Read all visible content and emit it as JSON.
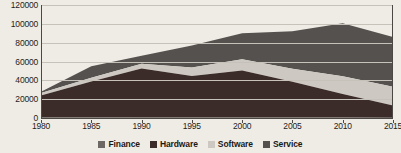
{
  "chart_data": {
    "type": "area",
    "stacked": true,
    "title": "",
    "xlabel": "",
    "ylabel": "",
    "x": [
      1980,
      1985,
      1990,
      1995,
      2000,
      2005,
      2010,
      2015
    ],
    "xlim": [
      1980,
      2015
    ],
    "ylim": [
      0,
      120000
    ],
    "ytick_values": [
      0,
      20000,
      40000,
      60000,
      80000,
      100000,
      120000
    ],
    "ytick_labels": [
      "0",
      "20000",
      "40000",
      "60000",
      "80000",
      "100000",
      "120000"
    ],
    "xtick_labels": [
      "1980",
      "1985",
      "1990",
      "1995",
      "2000",
      "2005",
      "2010",
      "2015"
    ],
    "grid": true,
    "legend_position": "bottom",
    "series": [
      {
        "name": "Finance",
        "color": "#6d6863",
        "values": [
          900,
          700,
          600,
          500,
          500,
          400,
          400,
          300
        ]
      },
      {
        "name": "Hardware",
        "color": "#3b2b29",
        "values": [
          23000,
          38000,
          52000,
          44000,
          50000,
          38000,
          25000,
          13000
        ]
      },
      {
        "name": "Software",
        "color": "#cdc9c2",
        "values": [
          2600,
          4000,
          5000,
          9000,
          12000,
          14000,
          19000,
          20000
        ]
      },
      {
        "name": "Service",
        "color": "#55514e",
        "values": [
          1500,
          12300,
          8400,
          23500,
          27500,
          39600,
          56200,
          52700
        ]
      }
    ],
    "totals": [
      28000,
      55000,
      66000,
      77000,
      90000,
      92000,
      100600,
      86000
    ]
  },
  "legend": {
    "items": [
      {
        "label": "Finance",
        "color": "#6d6863"
      },
      {
        "label": "Hardware",
        "color": "#3b2b29"
      },
      {
        "label": "Software",
        "color": "#cdc9c2"
      },
      {
        "label": "Service",
        "color": "#55514e"
      }
    ]
  },
  "colors": {
    "background": "#efece6",
    "grid": "#c6c2ba",
    "axis": "#4a4744",
    "text": "#1e1c1a"
  }
}
